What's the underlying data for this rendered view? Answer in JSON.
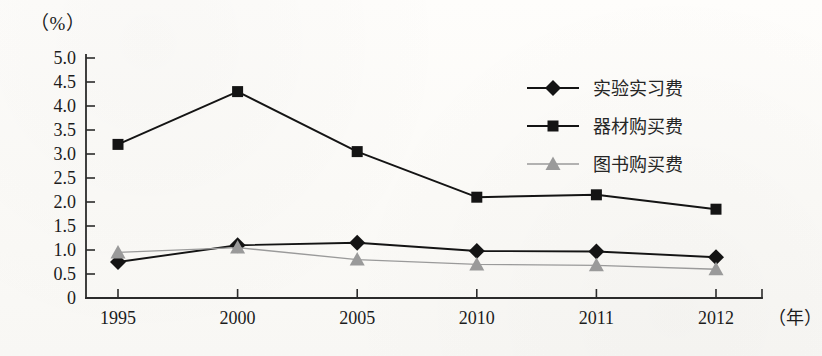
{
  "chart_data": {
    "type": "line",
    "title": "",
    "xlabel": "年",
    "ylabel": "%",
    "y_unit_label": "（%）",
    "x_unit_label": "（年）",
    "categories": [
      "1995",
      "2000",
      "2005",
      "2010",
      "2011",
      "2012"
    ],
    "ylim": [
      0,
      5.0
    ],
    "ytick_step": 0.5,
    "ytick_labels": [
      "0",
      "0.5",
      "1.0",
      "1.5",
      "2.0",
      "2.5",
      "3.0",
      "3.5",
      "4.0",
      "4.5",
      "5.0"
    ],
    "grid": false,
    "legend_position": "upper-right-inside",
    "series": [
      {
        "name": "实验实习费",
        "marker": "diamond",
        "color": "#141414",
        "values": [
          0.75,
          1.1,
          1.15,
          0.98,
          0.97,
          0.85
        ]
      },
      {
        "name": "器材购买费",
        "marker": "square",
        "color": "#141414",
        "values": [
          3.2,
          4.3,
          3.05,
          2.1,
          2.15,
          1.85
        ]
      },
      {
        "name": "图书购买费",
        "marker": "triangle",
        "color": "#9a9a9a",
        "values": [
          0.95,
          1.05,
          0.8,
          0.7,
          0.68,
          0.6
        ]
      }
    ]
  },
  "colors": {
    "ink": "#141414",
    "gray_series": "#9a9a9a",
    "axis": "#2b2b2b",
    "paper": "#fdfcfa"
  }
}
